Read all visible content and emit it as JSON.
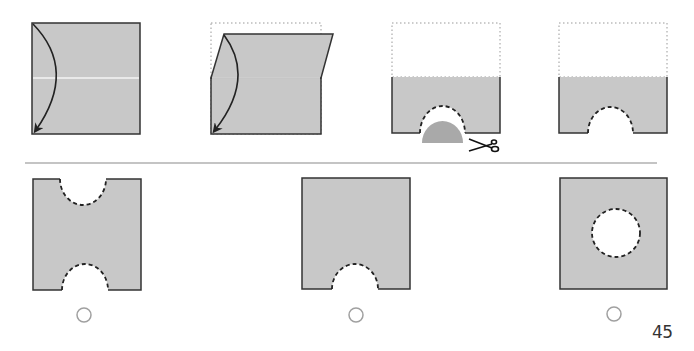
{
  "puzzle": {
    "type": "paper-folding",
    "steps": [
      {
        "id": 1,
        "description": "square with fold arrow (top edge folds down to bottom)"
      },
      {
        "id": 2,
        "description": "fold in progress, dotted outline of original"
      },
      {
        "id": 3,
        "description": "folded half with semicircle cut at bottom, scissors"
      },
      {
        "id": 4,
        "description": "folded half with semicircle notch"
      }
    ],
    "options": [
      {
        "id": "A",
        "label": "",
        "description": "notches at top and bottom"
      },
      {
        "id": "B",
        "label": "",
        "description": "single notch at bottom"
      },
      {
        "id": "C",
        "label": "",
        "description": "circular hole in center"
      }
    ]
  },
  "colors": {
    "paper": "#c8c8c8",
    "outline": "#333333",
    "cut_piece": "#a9a9a9",
    "separator": "#b0b0b0",
    "radio": "#a0a0a0"
  },
  "page_number": "45"
}
